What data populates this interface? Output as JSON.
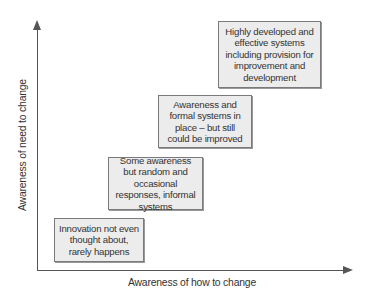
{
  "diagram": {
    "type": "staircase-matrix",
    "x_axis_label": "Awareness of how to change",
    "y_axis_label": "Awareness of need to change",
    "boxes": [
      {
        "level": 1,
        "text": "Innovation not even thought about, rarely happens"
      },
      {
        "level": 2,
        "text": "Some awareness but random and occasional responses, informal systems"
      },
      {
        "level": 3,
        "text": "Awareness and formal systems in place – but still could be improved"
      },
      {
        "level": 4,
        "text": "Highly developed and effective systems including provision for improvement and development"
      }
    ]
  },
  "colors": {
    "box_fill": "#ececec",
    "box_border": "#7a7a7a",
    "axis": "#555555",
    "text": "#333333"
  }
}
